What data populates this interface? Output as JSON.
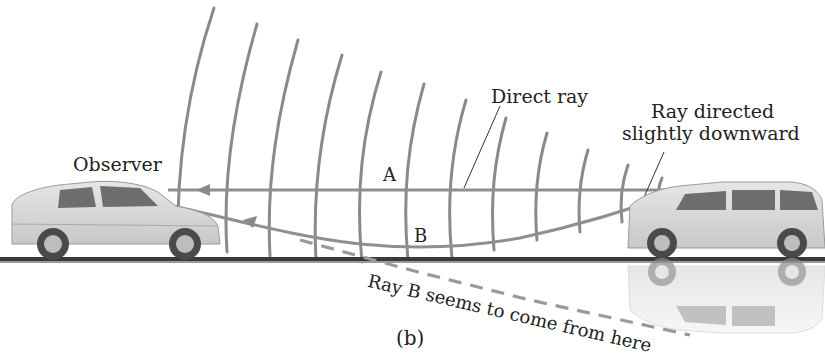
{
  "figure": {
    "panel_label": "(b)",
    "labels": {
      "observer": "Observer",
      "direct_ray": "Direct ray",
      "ray_directed_line1": "Ray directed",
      "ray_directed_line2": "slightly downward",
      "point_a": "A",
      "point_b": "B",
      "apparent_source": "Ray B seems to come from here"
    },
    "objects": {
      "observer_car": "sedan",
      "source_car": "minivan",
      "mirage": "inverted minivan reflection below road"
    },
    "colors": {
      "ray": "#8f8f8f",
      "wavefront": "#8a8a8a",
      "road": "#3a3a3a",
      "text": "#222222",
      "car_body": "#d9d9d9"
    }
  }
}
